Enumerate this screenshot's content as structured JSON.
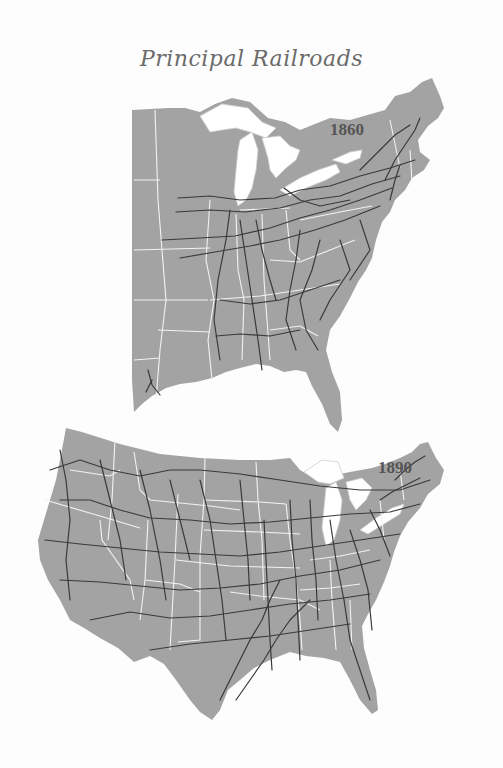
{
  "title": "Principal Railroads",
  "maps": [
    {
      "id": "map-1860",
      "year_label": "1860",
      "region": "Eastern United States"
    },
    {
      "id": "map-1890",
      "year_label": "1890",
      "region": "Contiguous United States"
    }
  ],
  "colors": {
    "land": "#a3a3a3",
    "water": "#ffffff",
    "state_borders": "#f2f2f2",
    "railroads": "#3a3a3a",
    "title_text": "#6b6b6b",
    "year_text": "#555555"
  }
}
